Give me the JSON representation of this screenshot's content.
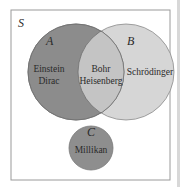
{
  "diagram": {
    "type": "venn",
    "universe": {
      "label": "S"
    },
    "sets": [
      {
        "id": "A",
        "label": "A",
        "members_only": [
          "Einstein",
          "Dirac"
        ]
      },
      {
        "id": "B",
        "label": "B",
        "members_only": [
          "Schrödinger"
        ]
      },
      {
        "id": "C",
        "label": "C",
        "members_only": [
          "Millikan"
        ]
      }
    ],
    "intersections": [
      {
        "sets": [
          "A",
          "B"
        ],
        "members": [
          "Bohr",
          "Heisenberg"
        ]
      }
    ],
    "colors": {
      "set_a": "#8c8c8c",
      "set_b": "#d6d6d6",
      "intersection_ab": "#c4c4c4",
      "set_c": "#8e8e8e",
      "border": "#9a9a9a",
      "background": "#ffffff"
    }
  },
  "labels": {
    "S": "S",
    "A": "A",
    "B": "B",
    "C": "C",
    "a_line1": "Einstein",
    "a_line2": "Dirac",
    "ab_line1": "Bohr",
    "ab_line2": "Heisenberg",
    "b_line1": "Schrödinger",
    "c_line1": "Millikan"
  }
}
